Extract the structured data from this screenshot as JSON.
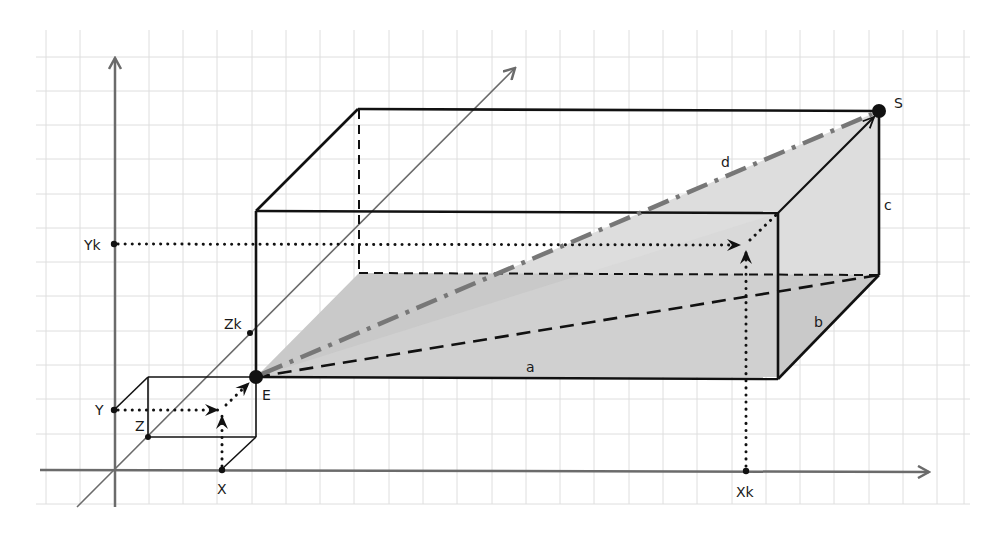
{
  "diagram": {
    "type": "3d-cuboid-space-diagonal",
    "grid": {
      "spacing_px": 34.3,
      "visible": true
    },
    "axes": {
      "x": {
        "label": "",
        "direction": "right"
      },
      "y": {
        "label": "",
        "direction": "up"
      },
      "z": {
        "label": "",
        "direction": "diagonal-back"
      }
    },
    "points": {
      "E": "E",
      "S": "S",
      "X": "X",
      "Y": "Y",
      "Z": "Z",
      "Xk": "Xk",
      "Yk": "Yk",
      "Zk": "Zk"
    },
    "edges": {
      "a": "a",
      "b": "b",
      "c": "c",
      "d": "d"
    },
    "colors": {
      "axis": "#6b6b6b",
      "edge": "#111111",
      "diagonal_d": "#777777",
      "floor_fill": "#c9c9c9",
      "side_fill": "#dddddd",
      "grid": "#dedede"
    }
  }
}
